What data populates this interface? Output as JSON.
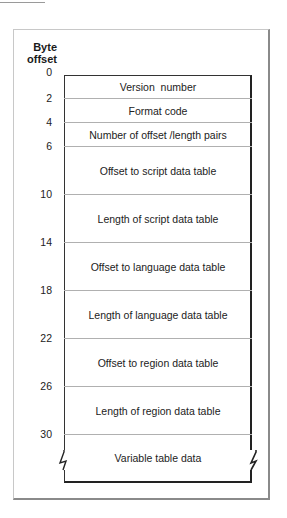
{
  "diagram": {
    "header": {
      "line1": "Byte",
      "line2": "offset"
    },
    "offsets": [
      "0",
      "2",
      "4",
      "6",
      "10",
      "14",
      "18",
      "22",
      "26",
      "30"
    ],
    "fields": [
      {
        "label": "Version  number",
        "start": 0,
        "size": 2
      },
      {
        "label": "Format code",
        "start": 2,
        "size": 2
      },
      {
        "label": "Number of offset /length pairs",
        "start": 4,
        "size": 2
      },
      {
        "label": "Offset to script data table",
        "start": 6,
        "size": 4
      },
      {
        "label": "Length of script data table",
        "start": 10,
        "size": 4
      },
      {
        "label": "Offset to language data table",
        "start": 14,
        "size": 4
      },
      {
        "label": "Length of language data table",
        "start": 18,
        "size": 4
      },
      {
        "label": "Offset to region data table",
        "start": 22,
        "size": 4
      },
      {
        "label": "Length of region data table",
        "start": 26,
        "size": 4
      },
      {
        "label": "Variable table data",
        "start": 30,
        "size": "variable"
      }
    ],
    "colors": {
      "line": "#222222",
      "divider": "#b0b0b0",
      "frame": "#c8c8c8",
      "frame_shadow": "#8a8a8a"
    }
  }
}
